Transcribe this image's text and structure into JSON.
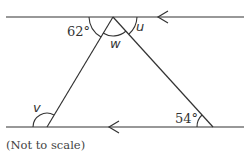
{
  "diagram": {
    "type": "geometry-parallel-lines-triangle",
    "labels": {
      "angle_top_left": "62°",
      "angle_top_middle": "w",
      "angle_top_right": "u",
      "angle_bottom_left": "v",
      "angle_bottom_right": "54°"
    },
    "note": "(Not to scale)",
    "colors": {
      "stroke": "#333333",
      "background": "#ffffff"
    }
  }
}
